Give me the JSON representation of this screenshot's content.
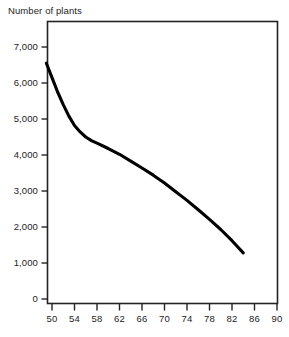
{
  "chart_data": {
    "type": "line",
    "title": "Number of plants",
    "xlabel": "",
    "ylabel": "",
    "grid": false,
    "legend": "none",
    "line_color": "#000000",
    "axis_color": "#232323",
    "background_color": "#ffffff",
    "xlim": [
      48.5,
      90
    ],
    "ylim": [
      0,
      7560
    ],
    "x_ticks": [
      50,
      54,
      58,
      62,
      66,
      70,
      74,
      78,
      82,
      86,
      90
    ],
    "x_tick_labels": [
      "50",
      "54",
      "58",
      "62",
      "66",
      "70",
      "74",
      "78",
      "82",
      "86",
      "90"
    ],
    "y_ticks": [
      0,
      1000,
      2000,
      3000,
      4000,
      5000,
      6000,
      7000
    ],
    "y_tick_labels": [
      "0",
      "1,000",
      "2,000",
      "3,000",
      "4,000",
      "5,000",
      "6,000",
      "7,000"
    ],
    "series": [
      {
        "name": "Number of plants",
        "x": [
          49.0,
          50.0,
          51.0,
          52.0,
          53.0,
          54.0,
          55.0,
          56.0,
          57.0,
          58.0,
          60.0,
          62.0,
          64.0,
          66.0,
          68.0,
          70.0,
          72.0,
          74.0,
          76.0,
          78.0,
          80.0,
          82.0,
          84.0
        ],
        "y": [
          6550,
          6150,
          5750,
          5400,
          5080,
          4820,
          4640,
          4500,
          4400,
          4330,
          4180,
          4020,
          3830,
          3640,
          3440,
          3220,
          2980,
          2740,
          2480,
          2210,
          1930,
          1620,
          1280
        ]
      }
    ]
  }
}
